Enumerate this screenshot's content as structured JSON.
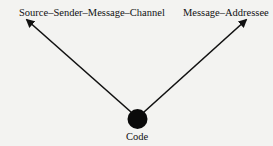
{
  "diagram": {
    "nodes": [
      {
        "id": "left",
        "label": "Source–Sender–Message–Channel"
      },
      {
        "id": "right",
        "label": "Message–Addressee"
      },
      {
        "id": "center",
        "label": "Code",
        "shape": "filled-circle"
      }
    ],
    "edges": [
      {
        "from": "center",
        "to": "left",
        "style": "arrow"
      },
      {
        "from": "center",
        "to": "right",
        "style": "arrow"
      }
    ],
    "colors": {
      "ink": "#111111",
      "background": "#f3f3f1"
    }
  }
}
